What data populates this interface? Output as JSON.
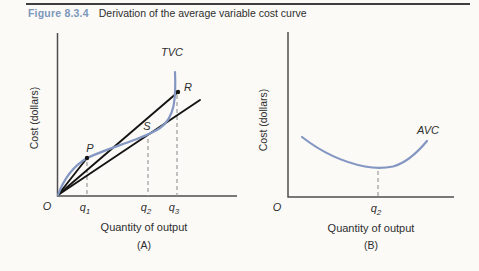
{
  "header": {
    "figure_label": "Figure 8.3.4",
    "caption": "Derivation of the average variable cost curve",
    "accent_color": "#7b97bb"
  },
  "colors": {
    "curve": "#8496c2",
    "ray": "#141414",
    "axis": "#4d4d4d",
    "dashed": "#9b9b9b",
    "text": "#2e2e2e",
    "background": "#fbfaf7"
  },
  "chart_a": {
    "ylabel": "Cost (dollars)",
    "xlabel": "Quantity of output",
    "panel_label": "(A)",
    "origin_label": "O",
    "curve_label": "TVC",
    "ticks": [
      {
        "base": "q",
        "sub": "1"
      },
      {
        "base": "q",
        "sub": "2"
      },
      {
        "base": "q",
        "sub": "3"
      }
    ],
    "point_labels": {
      "p": "P",
      "s": "S",
      "r": "R"
    }
  },
  "chart_b": {
    "ylabel": "Cost (dollars)",
    "xlabel": "Quantity of output",
    "panel_label": "(B)",
    "origin_label": "O",
    "curve_label": "AVC",
    "ticks": [
      {
        "base": "q",
        "sub": "2"
      }
    ]
  },
  "geometry": {
    "axis_a": "M 57.5 33 L 57.5 196 L 237 196",
    "tvc": "M 58 195 C 63 181 72 167 87 158 C 100 152 118 146 134 140 C 143 136.5 152 133.5 160 128 C 168 122.5 171.5 115.5 173.5 106 C 175.3 97 175.6 85 175 72",
    "ray_op": "M 58 195 L 87 158",
    "ray_or": "M 58 195 L 178 92",
    "ray_tangent": "M 58 195 L 200 100",
    "dash_q1_a": "M 87 162 L 87 196",
    "dash_q2_a": "M 148 139 L 148 196",
    "dash_q3_a": "M 177 95 L 177 196",
    "axis_b": "M 288 32 L 288 197 L 454 197",
    "avc": "M 302 137 C 320 151 342 162 365 166.5 C 373 168 384 168.3 393 166.5 C 406 163 417 153 427 141",
    "dash_q2_b": "M 378 171 L 378 196",
    "points": {
      "p": {
        "x": 87,
        "y": 158
      },
      "r": {
        "x": 178,
        "y": 92
      }
    }
  },
  "chart_data": [
    {
      "type": "line",
      "panel": "A",
      "title": "(A)",
      "xlabel": "Quantity of output",
      "ylabel": "Cost (dollars)",
      "x_ticks": [
        "O",
        "q1",
        "q2",
        "q3"
      ],
      "x_tick_positions": [
        0,
        1.6,
        5.0,
        6.6
      ],
      "xlim": [
        0,
        10
      ],
      "ylim": [
        0,
        10
      ],
      "grid": false,
      "series": [
        {
          "name": "TVC",
          "style": "curve",
          "color": "#8496c2",
          "x": [
            0,
            0.5,
            1.0,
            1.6,
            2.5,
            3.5,
            4.2,
            5.0,
            5.7,
            6.1,
            6.4,
            6.5,
            6.5
          ],
          "y": [
            0,
            1.0,
            1.7,
            2.3,
            2.8,
            3.2,
            3.45,
            3.65,
            4.2,
            5.0,
            6.1,
            7.0,
            7.6
          ]
        },
        {
          "name": "ray O-P",
          "style": "segment",
          "color": "#141414",
          "from": [
            0,
            0
          ],
          "to": [
            1.6,
            2.3
          ]
        },
        {
          "name": "ray O-R",
          "style": "segment",
          "color": "#141414",
          "from": [
            0,
            0
          ],
          "to": [
            6.6,
            6.4
          ]
        },
        {
          "name": "tangent ray through S",
          "style": "segment",
          "color": "#141414",
          "from": [
            0,
            0
          ],
          "to": [
            7.9,
            5.9
          ]
        }
      ],
      "points": [
        {
          "label": "P",
          "x": 1.6,
          "y": 2.3
        },
        {
          "label": "S",
          "x": 5.0,
          "y": 3.65
        },
        {
          "label": "R",
          "x": 6.6,
          "y": 6.4
        }
      ],
      "dashed_guides_at_x": [
        1.6,
        5.0,
        6.6
      ],
      "annotations": [
        "TVC"
      ],
      "notes": "Rays from origin O to points P, S, R on the TVC curve; the slope of each ray equals AVC at that output. The ray tangent at S (output q2) has minimum slope, so AVC is minimized at q2."
    },
    {
      "type": "line",
      "panel": "B",
      "title": "(B)",
      "xlabel": "Quantity of output",
      "ylabel": "Cost (dollars)",
      "x_ticks": [
        "O",
        "q2"
      ],
      "x_tick_positions": [
        0,
        5.0
      ],
      "xlim": [
        0,
        10
      ],
      "ylim": [
        0,
        10
      ],
      "grid": false,
      "series": [
        {
          "name": "AVC",
          "style": "curve",
          "color": "#8496c2",
          "x": [
            0.8,
            1.8,
            2.8,
            3.8,
            5.0,
            6.0,
            7.0,
            7.8
          ],
          "y": [
            3.6,
            3.0,
            2.6,
            2.3,
            2.15,
            2.3,
            2.8,
            3.45
          ]
        }
      ],
      "points": [
        {
          "label": "minimum AVC",
          "x": 5.0,
          "y": 2.15
        }
      ],
      "dashed_guides_at_x": [
        5.0
      ],
      "annotations": [
        "AVC"
      ],
      "notes": "U-shaped AVC curve whose minimum occurs at output q2, matching the tangency point S in panel A."
    }
  ]
}
